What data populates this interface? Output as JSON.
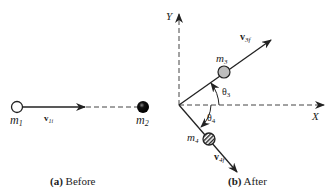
{
  "panel_a": {
    "caption_letter": "(a)",
    "caption_text": " Before",
    "m1_label": "m",
    "m1_sub": "1",
    "m2_label": "m",
    "m2_sub": "2",
    "v1_label": "v",
    "v1_sub": "1i"
  },
  "panel_b": {
    "caption_letter": "(b)",
    "caption_text": " After",
    "y_axis_label": "Y",
    "x_axis_label": "X",
    "m3_label": "m",
    "m3_sub": "3",
    "m4_label": "m",
    "m4_sub": "4",
    "v3_label": "v",
    "v3_sub": "3f",
    "v4_label": "v",
    "v4_sub": "4f",
    "theta3_label": "θ",
    "theta3_sub": "3",
    "theta4_label": "θ",
    "theta4_sub": "4"
  },
  "colors": {
    "ink": "#222222",
    "m3_fill": "#bdbdbd",
    "m2_fill": "#111111"
  }
}
